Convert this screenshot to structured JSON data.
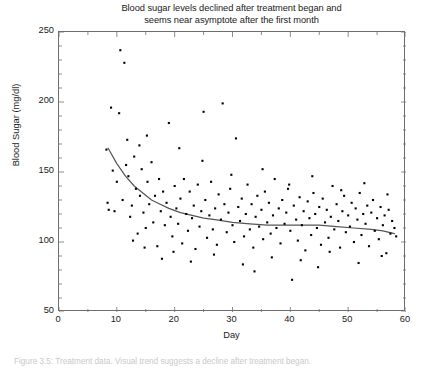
{
  "chart_data": {
    "type": "scatter",
    "title": "Blood sugar levels declined after treatment began and seems near asymptote after the first month",
    "title_line1": "Blood sugar levels declined after treatment began and",
    "title_line2": "seems near asymptote after the first month",
    "xlabel": "Day",
    "ylabel": "Blood Sugar (mg/dl)",
    "xlim": [
      0,
      60
    ],
    "ylim": [
      50,
      250
    ],
    "x_ticks": [
      0,
      10,
      20,
      30,
      40,
      50,
      60
    ],
    "y_ticks": [
      50,
      100,
      150,
      200,
      250
    ],
    "x_minor_step": 5,
    "y_minor_step": 10,
    "grid": false,
    "legend": "none",
    "marker_color": "#000000",
    "marker_size_px": 2.1,
    "frame_color": "#6e6e6e",
    "series": [
      {
        "name": "Blood sugar measurements",
        "type": "scatter",
        "points": [
          [
            8.2,
            166
          ],
          [
            8.4,
            128
          ],
          [
            8.6,
            123
          ],
          [
            9.0,
            196
          ],
          [
            9.3,
            151
          ],
          [
            9.6,
            122
          ],
          [
            10.0,
            143
          ],
          [
            10.4,
            192
          ],
          [
            10.6,
            237
          ],
          [
            11.0,
            130
          ],
          [
            11.3,
            228
          ],
          [
            11.6,
            155
          ],
          [
            12.0,
            147
          ],
          [
            12.3,
            118
          ],
          [
            12.6,
            126
          ],
          [
            13.0,
            161
          ],
          [
            13.3,
            138
          ],
          [
            13.6,
            106
          ],
          [
            14.0,
            133
          ],
          [
            14.3,
            152
          ],
          [
            14.6,
            121
          ],
          [
            15.0,
            110
          ],
          [
            15.3,
            143
          ],
          [
            15.6,
            127
          ],
          [
            16.0,
            157
          ],
          [
            16.3,
            114
          ],
          [
            16.6,
            133
          ],
          [
            17.0,
            97
          ],
          [
            17.3,
            145
          ],
          [
            17.6,
            122
          ],
          [
            18.0,
            136
          ],
          [
            18.3,
            112
          ],
          [
            18.6,
            128
          ],
          [
            19.0,
            185
          ],
          [
            19.3,
            118
          ],
          [
            19.6,
            104
          ],
          [
            20.0,
            140
          ],
          [
            20.3,
            124
          ],
          [
            20.6,
            113
          ],
          [
            21.0,
            131
          ],
          [
            21.3,
            99
          ],
          [
            21.6,
            145
          ],
          [
            22.0,
            120
          ],
          [
            22.3,
            108
          ],
          [
            22.6,
            136
          ],
          [
            23.0,
            117
          ],
          [
            23.3,
            126
          ],
          [
            23.6,
            95
          ],
          [
            24.0,
            141
          ],
          [
            24.3,
            111
          ],
          [
            24.6,
            122
          ],
          [
            25.0,
            193
          ],
          [
            25.3,
            130
          ],
          [
            25.6,
            103
          ],
          [
            26.0,
            119
          ],
          [
            26.3,
            143
          ],
          [
            26.6,
            109
          ],
          [
            27.0,
            124
          ],
          [
            27.3,
            98
          ],
          [
            27.6,
            134
          ],
          [
            28.0,
            116
          ],
          [
            28.3,
            199
          ],
          [
            28.6,
            127
          ],
          [
            29.0,
            107
          ],
          [
            29.3,
            121
          ],
          [
            29.6,
            138
          ],
          [
            30.0,
            112
          ],
          [
            30.3,
            100
          ],
          [
            30.6,
            174
          ],
          [
            31.0,
            125
          ],
          [
            31.3,
            115
          ],
          [
            31.6,
            131
          ],
          [
            32.0,
            104
          ],
          [
            32.3,
            120
          ],
          [
            32.6,
            141
          ],
          [
            33.0,
            109
          ],
          [
            33.3,
            127
          ],
          [
            33.6,
            96
          ],
          [
            34.0,
            118
          ],
          [
            34.3,
            133
          ],
          [
            34.6,
            111
          ],
          [
            35.0,
            123
          ],
          [
            35.3,
            102
          ],
          [
            35.6,
            136
          ],
          [
            36.0,
            114
          ],
          [
            36.3,
            128
          ],
          [
            36.6,
            106
          ],
          [
            37.0,
            119
          ],
          [
            37.3,
            145
          ],
          [
            37.6,
            110
          ],
          [
            38.0,
            124
          ],
          [
            38.3,
            99
          ],
          [
            38.6,
            130
          ],
          [
            39.0,
            113
          ],
          [
            39.3,
            121
          ],
          [
            39.6,
            138
          ],
          [
            40.0,
            108
          ],
          [
            40.3,
            73
          ],
          [
            40.6,
            126
          ],
          [
            41.0,
            116
          ],
          [
            41.3,
            101
          ],
          [
            41.6,
            132
          ],
          [
            42.0,
            112
          ],
          [
            42.3,
            122
          ],
          [
            42.6,
            94
          ],
          [
            43.0,
            129
          ],
          [
            43.3,
            117
          ],
          [
            43.6,
            105
          ],
          [
            44.0,
            135
          ],
          [
            44.3,
            120
          ],
          [
            44.6,
            110
          ],
          [
            45.0,
            125
          ],
          [
            45.3,
            98
          ],
          [
            45.6,
            131
          ],
          [
            46.0,
            114
          ],
          [
            46.3,
            123
          ],
          [
            46.6,
            103
          ],
          [
            47.0,
            118
          ],
          [
            47.3,
            140
          ],
          [
            47.6,
            109
          ],
          [
            48.0,
            127
          ],
          [
            48.3,
            115
          ],
          [
            48.6,
            96
          ],
          [
            49.0,
            122
          ],
          [
            49.3,
            133
          ],
          [
            49.6,
            107
          ],
          [
            50.0,
            119
          ],
          [
            50.3,
            111
          ],
          [
            50.6,
            128
          ],
          [
            51.0,
            100
          ],
          [
            51.3,
            124
          ],
          [
            51.6,
            116
          ],
          [
            52.0,
            135
          ],
          [
            52.3,
            105
          ],
          [
            52.6,
            120
          ],
          [
            53.0,
            113
          ],
          [
            53.3,
            126
          ],
          [
            53.6,
            97
          ],
          [
            54.0,
            121
          ],
          [
            54.3,
            130
          ],
          [
            54.6,
            108
          ],
          [
            55.0,
            117
          ],
          [
            55.3,
            102
          ],
          [
            55.6,
            125
          ],
          [
            56.0,
            112
          ],
          [
            56.3,
            119
          ],
          [
            56.6,
            92
          ],
          [
            57.0,
            123
          ],
          [
            57.3,
            106
          ],
          [
            57.6,
            115
          ],
          [
            58.0,
            110
          ],
          [
            58.3,
            104
          ],
          [
            13.9,
            169
          ],
          [
            15.2,
            176
          ],
          [
            11.8,
            173
          ],
          [
            20.8,
            167
          ],
          [
            24.8,
            158
          ],
          [
            29.8,
            148
          ],
          [
            35.2,
            152
          ],
          [
            39.8,
            141
          ],
          [
            43.8,
            147
          ],
          [
            48.8,
            137
          ],
          [
            52.8,
            142
          ],
          [
            56.8,
            134
          ],
          [
            17.8,
            88
          ],
          [
            22.8,
            86
          ],
          [
            26.8,
            91
          ],
          [
            31.8,
            84
          ],
          [
            36.8,
            89
          ],
          [
            41.8,
            87
          ],
          [
            46.8,
            93
          ],
          [
            51.8,
            85
          ],
          [
            55.8,
            90
          ],
          [
            12.8,
            101
          ],
          [
            14.8,
            96
          ],
          [
            19.8,
            93
          ],
          [
            33.8,
            79
          ],
          [
            44.8,
            82
          ]
        ]
      },
      {
        "name": "Fitted trend (loess)",
        "type": "line",
        "color": "#555555",
        "points": [
          [
            8.5,
            167
          ],
          [
            10,
            156
          ],
          [
            11.5,
            147
          ],
          [
            13,
            140
          ],
          [
            14.5,
            135
          ],
          [
            16,
            130
          ],
          [
            17.5,
            127
          ],
          [
            19,
            124
          ],
          [
            21,
            121
          ],
          [
            23,
            119
          ],
          [
            25,
            117
          ],
          [
            27,
            116
          ],
          [
            30,
            114
          ],
          [
            33,
            113
          ],
          [
            36,
            112
          ],
          [
            39,
            112
          ],
          [
            42,
            112
          ],
          [
            45,
            112
          ],
          [
            48,
            111
          ],
          [
            51,
            110
          ],
          [
            54,
            109
          ],
          [
            56,
            108
          ],
          [
            58,
            106
          ]
        ]
      }
    ],
    "caption": "Figure 3.5: Treatment data. Visual trend suggests a decline after treatment began."
  }
}
